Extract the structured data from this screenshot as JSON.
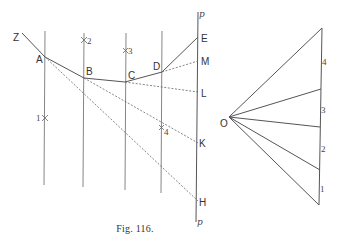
{
  "figure": {
    "caption": "Fig. 116.",
    "funicular": {
      "points": {
        "Z": {
          "label": "Z",
          "x": 22,
          "y": 33
        },
        "A": {
          "label": "A",
          "x": 45,
          "y": 57
        },
        "B": {
          "label": "B",
          "x": 84,
          "y": 78
        },
        "C": {
          "label": "C",
          "x": 125,
          "y": 82
        },
        "D": {
          "label": "D",
          "x": 162,
          "y": 72
        },
        "E": {
          "label": "E",
          "x": 198,
          "y": 37
        },
        "M": {
          "label": "M",
          "x": 198,
          "y": 61
        },
        "L": {
          "label": "L",
          "x": 198,
          "y": 92
        },
        "K": {
          "label": "K",
          "x": 198,
          "y": 143
        },
        "H": {
          "label": "H",
          "x": 198,
          "y": 201
        }
      },
      "line_p_label_top": "p",
      "line_p_label_bottom": "p",
      "forces": [
        {
          "label": "1",
          "x": 45,
          "y": 118
        },
        {
          "label": "2",
          "x": 84,
          "y": 40
        },
        {
          "label": "3",
          "x": 125,
          "y": 50
        },
        {
          "label": "4",
          "x": 162,
          "y": 128
        }
      ]
    },
    "force_polygon": {
      "pole_label": "O",
      "segments": [
        {
          "label": "4"
        },
        {
          "label": "3"
        },
        {
          "label": "2"
        },
        {
          "label": "1"
        }
      ]
    }
  }
}
